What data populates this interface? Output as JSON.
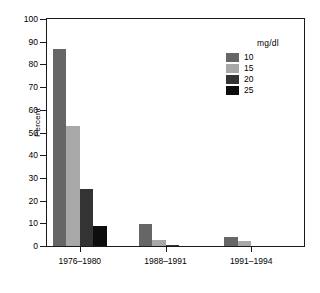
{
  "chart_data": {
    "type": "bar",
    "title": "",
    "xlabel": "",
    "ylabel": "Percent",
    "ylim": [
      0,
      100
    ],
    "yticks": [
      0,
      10,
      20,
      30,
      40,
      50,
      60,
      70,
      80,
      90,
      100
    ],
    "categories": [
      "1976–1980",
      "1988–1991",
      "1991–1994"
    ],
    "grid": false,
    "legend_position": "upper right",
    "legend_title": "mg/dl",
    "series": [
      {
        "name": "10",
        "color": "#666666",
        "values": [
          87,
          9.5,
          4
        ]
      },
      {
        "name": "15",
        "color": "#a8a8a8",
        "values": [
          53,
          2.5,
          2
        ]
      },
      {
        "name": "20",
        "color": "#333333",
        "values": [
          25,
          0.5,
          0
        ]
      },
      {
        "name": "25",
        "color": "#0d0d0d",
        "values": [
          9,
          0,
          0
        ]
      }
    ]
  },
  "axes": {
    "y_title": "Percent",
    "y_tick_labels": [
      "0",
      "10",
      "20",
      "30",
      "40",
      "50",
      "60",
      "70",
      "80",
      "90",
      "100"
    ],
    "x_tick_labels": [
      "1976–1980",
      "1988–1991",
      "1991–1994"
    ]
  },
  "legend": {
    "title": "mg/dl",
    "entries": [
      {
        "label": "10",
        "color": "#666666"
      },
      {
        "label": "15",
        "color": "#a8a8a8"
      },
      {
        "label": "20",
        "color": "#333333"
      },
      {
        "label": "25",
        "color": "#0d0d0d"
      }
    ]
  }
}
